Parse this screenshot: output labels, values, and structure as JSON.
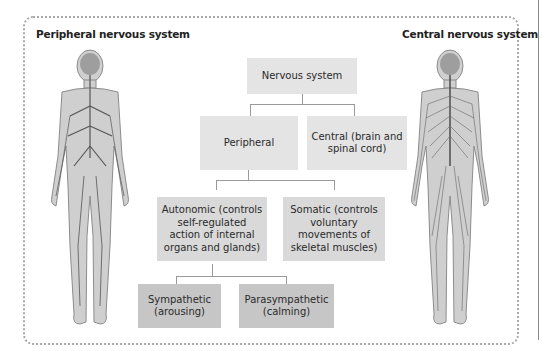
{
  "titles": {
    "left": "Peripheral nervous system",
    "right": "Central nervous system"
  },
  "boxes": {
    "nervous_system": "Nervous system",
    "peripheral": "Peripheral",
    "central": "Central (brain and spinal cord)",
    "autonomic": "Autonomic (controls self-regulated action of internal organs and glands)",
    "somatic": "Somatic (controls voluntary movements of skeletal muscles)",
    "sympathetic": "Sympathetic (arousing)",
    "parasympathetic": "Parasympathetic (calming)"
  },
  "figures": {
    "left": "peripheral-nervous-system-body-illustration",
    "right": "central-nervous-system-body-illustration"
  },
  "colors": {
    "level1": "#e4e4e4",
    "level2": "#d9d9d9",
    "level3": "#c6c6c6",
    "connector": "#9a9a9a",
    "frame": "#a8a8a8"
  }
}
